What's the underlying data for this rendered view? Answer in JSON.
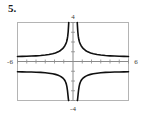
{
  "problem": {
    "number_label": "5."
  },
  "colors": {
    "curve": "#101010",
    "axis": "#8a8a8a",
    "frame": "#b4b4b4",
    "tick_label": "#3a3a3a",
    "background": "#ffffff"
  },
  "chart_data": {
    "type": "line",
    "title": "",
    "subtitle": "",
    "xlabel": "",
    "ylabel": "",
    "xlim": [
      -6,
      6
    ],
    "ylim": [
      -4,
      4
    ],
    "grid": false,
    "legend": false,
    "legend_position": "none",
    "axis_labels": {
      "x_left": "-6",
      "x_right": "6",
      "y_top": "4",
      "y_bottom": "-4"
    },
    "x_ticks": [
      -6,
      -5,
      -4,
      -3,
      -2,
      -1,
      0,
      1,
      2,
      3,
      4,
      5,
      6
    ],
    "x_tick_labels": [
      "-6",
      "",
      "",
      "",
      "",
      "",
      "",
      "",
      "",
      "",
      "",
      "",
      "6"
    ],
    "y_ticks": [
      -4,
      -3,
      -2,
      -1,
      0,
      1,
      2,
      3,
      4
    ],
    "y_tick_labels": [
      "-4",
      "",
      "",
      "",
      "",
      "",
      "",
      "",
      "4"
    ],
    "vertical_asymptotes": [
      -0.45,
      0.45
    ],
    "horizontal_asymptotes": [
      0.5,
      -1.05
    ],
    "series": [
      {
        "name": "upper-branch",
        "description": "Even curve decaying from +4 near x=-0.45 to y=0.5 at x=-6, mirrored on the right",
        "x": [
          -6.0,
          -5.5,
          -5.0,
          -4.5,
          -4.0,
          -3.5,
          -3.0,
          -2.6,
          -2.2,
          -1.9,
          -1.6,
          -1.35,
          -1.15,
          -1.0,
          -0.88,
          -0.78,
          -0.7,
          -0.63,
          -0.57,
          -0.52,
          -0.48,
          -0.46
        ],
        "values": [
          0.52,
          0.53,
          0.54,
          0.56,
          0.58,
          0.61,
          0.66,
          0.71,
          0.79,
          0.87,
          0.99,
          1.13,
          1.29,
          1.45,
          1.62,
          1.8,
          2.0,
          2.25,
          2.6,
          3.05,
          3.65,
          4.0
        ]
      },
      {
        "name": "upper-branch-mirror",
        "description": "Mirror of upper-branch for positive x",
        "x": [
          0.46,
          0.48,
          0.52,
          0.57,
          0.63,
          0.7,
          0.78,
          0.88,
          1.0,
          1.15,
          1.35,
          1.6,
          1.9,
          2.2,
          2.6,
          3.0,
          3.5,
          4.0,
          4.5,
          5.0,
          5.5,
          6.0
        ],
        "values": [
          4.0,
          3.65,
          3.05,
          2.6,
          2.25,
          2.0,
          1.8,
          1.62,
          1.45,
          1.29,
          1.13,
          0.99,
          0.87,
          0.79,
          0.71,
          0.66,
          0.61,
          0.58,
          0.56,
          0.54,
          0.53,
          0.52
        ]
      },
      {
        "name": "lower-branch",
        "description": "Even curve rising from y=-1.05 at x=-6 toward -4 as x approaches -0.45 from the left",
        "x": [
          -6.0,
          -5.5,
          -5.0,
          -4.5,
          -4.0,
          -3.5,
          -3.0,
          -2.6,
          -2.2,
          -1.9,
          -1.6,
          -1.4,
          -1.2,
          -1.05,
          -0.95,
          -0.85,
          -0.78,
          -0.72,
          -0.66,
          -0.6,
          -0.55,
          -0.5,
          -0.47
        ],
        "values": [
          -1.05,
          -1.06,
          -1.07,
          -1.08,
          -1.1,
          -1.12,
          -1.16,
          -1.2,
          -1.26,
          -1.32,
          -1.42,
          -1.5,
          -1.62,
          -1.74,
          -1.85,
          -2.0,
          -2.15,
          -2.32,
          -2.58,
          -2.95,
          -3.4,
          -3.85,
          -4.0
        ]
      },
      {
        "name": "lower-branch-mirror",
        "description": "Mirror of lower-branch for positive x",
        "x": [
          0.47,
          0.5,
          0.55,
          0.6,
          0.66,
          0.72,
          0.78,
          0.85,
          0.95,
          1.05,
          1.2,
          1.4,
          1.6,
          1.9,
          2.2,
          2.6,
          3.0,
          3.5,
          4.0,
          4.5,
          5.0,
          5.5,
          6.0
        ],
        "values": [
          -4.0,
          -3.85,
          -3.4,
          -2.95,
          -2.58,
          -2.32,
          -2.15,
          -2.0,
          -1.85,
          -1.74,
          -1.62,
          -1.5,
          -1.42,
          -1.32,
          -1.26,
          -1.2,
          -1.16,
          -1.12,
          -1.1,
          -1.08,
          -1.07,
          -1.06,
          -1.05
        ]
      }
    ]
  }
}
